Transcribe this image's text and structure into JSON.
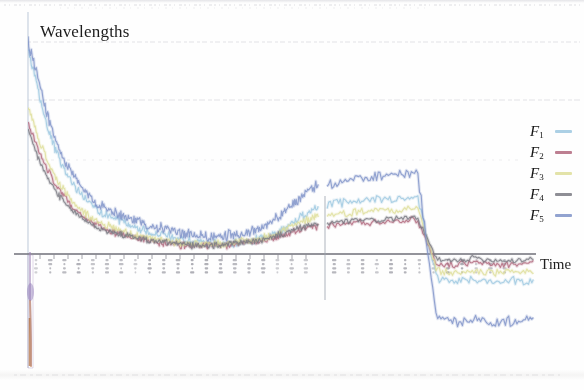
{
  "figure": {
    "title": "Wavelengths",
    "x_axis_label": "Time",
    "background_color": "#fefefe",
    "axis_color": "#7d7d86",
    "gridline_color": "#e2e2e6",
    "title_color": "#1c1c1c"
  },
  "legend": {
    "position": "right",
    "entries": [
      {
        "label": "F",
        "subscript": "1",
        "color": "#9ec8e0"
      },
      {
        "label": "F",
        "subscript": "2",
        "color": "#b2697e"
      },
      {
        "label": "F",
        "subscript": "3",
        "color": "#dede9a"
      },
      {
        "label": "F",
        "subscript": "4",
        "color": "#7a7a82"
      },
      {
        "label": "F",
        "subscript": "5",
        "color": "#7f93c8"
      }
    ]
  },
  "chart_data": {
    "type": "line",
    "title": "Wavelengths",
    "xlabel": "Time",
    "ylabel": "",
    "grid": true,
    "gridlines_y": [
      42,
      100,
      160,
      254,
      375
    ],
    "legend_position": "right",
    "axis_break_x": 325,
    "xlim": [
      0,
      100
    ],
    "ylim": [
      -100,
      100
    ],
    "x": [
      0,
      1,
      2,
      3,
      4,
      5,
      6,
      7,
      8,
      9,
      10,
      12,
      14,
      16,
      18,
      20,
      24,
      28,
      32,
      36,
      40,
      44,
      48,
      52,
      56,
      58,
      60,
      62,
      64,
      66,
      68,
      70,
      72,
      74,
      76,
      78,
      80,
      84,
      88,
      92,
      96,
      100
    ],
    "series": [
      {
        "name": "F1",
        "color": "#9ec8e0",
        "values": [
          96,
          78,
          60,
          47,
          38,
          31,
          26,
          22,
          19,
          17,
          15,
          13,
          11,
          10,
          9,
          8,
          7,
          6,
          6,
          5,
          5,
          5,
          5,
          6,
          7,
          8,
          10,
          13,
          16,
          19,
          22,
          24,
          25,
          26,
          26,
          27,
          -12,
          -13,
          -12,
          -13,
          -12,
          -13
        ]
      },
      {
        "name": "F2",
        "color": "#b2697e",
        "values": [
          62,
          50,
          40,
          32,
          26,
          21,
          17,
          14,
          12,
          10,
          9,
          8,
          7,
          6,
          5,
          5,
          4,
          4,
          4,
          4,
          4,
          4,
          5,
          5,
          6,
          7,
          8,
          9,
          11,
          12,
          13,
          14,
          15,
          15,
          16,
          16,
          -5,
          -5,
          -4,
          -5,
          -5,
          -4
        ]
      },
      {
        "name": "F3",
        "color": "#dede9a",
        "values": [
          70,
          56,
          44,
          35,
          28,
          23,
          19,
          16,
          14,
          12,
          11,
          9,
          8,
          7,
          7,
          6,
          5,
          5,
          5,
          5,
          5,
          5,
          6,
          6,
          7,
          8,
          10,
          12,
          14,
          16,
          18,
          19,
          20,
          21,
          21,
          22,
          -8,
          -9,
          -8,
          -9,
          -8,
          -9
        ]
      },
      {
        "name": "F4",
        "color": "#7a7a82",
        "values": [
          58,
          46,
          36,
          29,
          23,
          19,
          16,
          13,
          11,
          10,
          9,
          8,
          7,
          6,
          6,
          5,
          5,
          4,
          4,
          4,
          4,
          5,
          5,
          6,
          6,
          7,
          9,
          10,
          12,
          13,
          14,
          15,
          16,
          16,
          17,
          17,
          -3,
          -3,
          -2,
          -3,
          -3,
          -2
        ]
      },
      {
        "name": "F5",
        "color": "#7f93c8",
        "values": [
          100,
          84,
          66,
          52,
          42,
          35,
          29,
          25,
          22,
          20,
          18,
          16,
          14,
          13,
          12,
          11,
          10,
          9,
          9,
          8,
          8,
          9,
          9,
          10,
          12,
          14,
          17,
          21,
          25,
          29,
          32,
          34,
          36,
          37,
          38,
          38,
          -30,
          -32,
          -30,
          -33,
          -31,
          -30
        ]
      }
    ]
  }
}
